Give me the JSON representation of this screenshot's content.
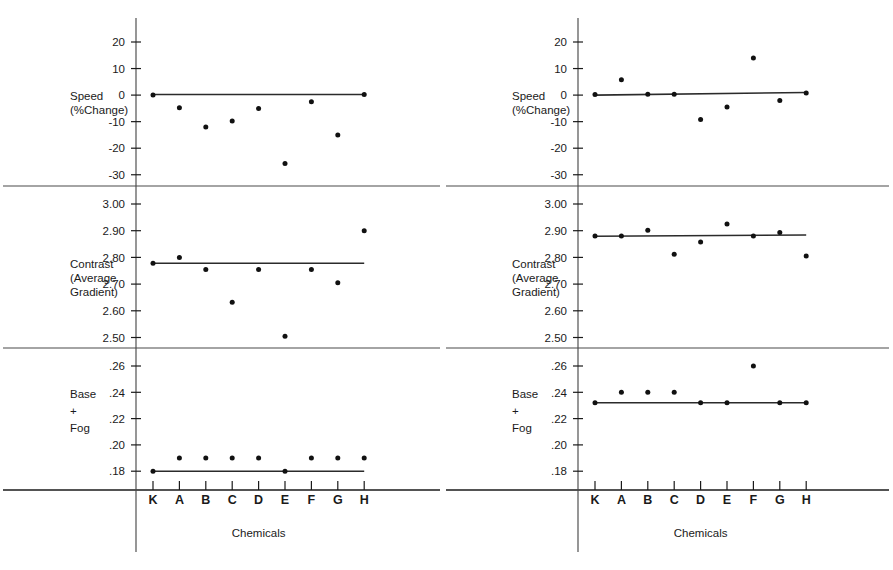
{
  "figure": {
    "panels": [
      {
        "id": "left",
        "x_title": "Chemicals",
        "categories": [
          "K",
          "A",
          "B",
          "C",
          "D",
          "E",
          "F",
          "G",
          "H"
        ],
        "sections": [
          {
            "id": "speed",
            "axis_label_lines": [
              "Speed",
              "(%Change)"
            ],
            "ticks": [
              "20",
              "10",
              "0",
              "-10",
              "-20",
              "-30"
            ],
            "tick_values": [
              20,
              10,
              0,
              -10,
              -20,
              -30
            ],
            "values": [
              0,
              -4.8,
              -12.0,
              -9.8,
              -5.0,
              -25.8,
              -2.5,
              -15.0,
              0.2
            ],
            "reference_line": {
              "from": 0,
              "to": 8,
              "y_from": 0.2,
              "y_to": 0.2
            }
          },
          {
            "id": "contrast",
            "axis_label_lines": [
              "Contrast",
              "(Average",
              "Gradient)"
            ],
            "ticks": [
              "3.00",
              "2.90",
              "2.80",
              "2.70",
              "2.60",
              "2.50"
            ],
            "tick_values": [
              3.0,
              2.9,
              2.8,
              2.7,
              2.6,
              2.5
            ],
            "values": [
              2.778,
              2.8,
              2.755,
              2.632,
              2.755,
              2.505,
              2.755,
              2.705,
              2.9
            ],
            "reference_line": {
              "from": 0,
              "to": 8,
              "y_from": 2.778,
              "y_to": 2.778
            }
          },
          {
            "id": "base-fog",
            "axis_label_lines": [
              "Base",
              "+",
              "Fog"
            ],
            "ticks": [
              ".26",
              ".24",
              ".22",
              ".20",
              ".18"
            ],
            "tick_values": [
              0.26,
              0.24,
              0.22,
              0.2,
              0.18
            ],
            "values": [
              0.18,
              0.19,
              0.19,
              0.19,
              0.19,
              0.18,
              0.19,
              0.19,
              0.19
            ],
            "reference_line": {
              "from": 0,
              "to": 8,
              "y_from": 0.18,
              "y_to": 0.18
            }
          }
        ]
      },
      {
        "id": "right",
        "x_title": "Chemicals",
        "categories": [
          "K",
          "A",
          "B",
          "C",
          "D",
          "E",
          "F",
          "G",
          "H"
        ],
        "sections": [
          {
            "id": "speed",
            "axis_label_lines": [
              "Speed",
              "(%Change)"
            ],
            "ticks": [
              "20",
              "10",
              "0",
              "-10",
              "-20",
              "-30"
            ],
            "tick_values": [
              20,
              10,
              0,
              -10,
              -20,
              -30
            ],
            "values": [
              0.2,
              5.8,
              0.3,
              0.3,
              -9.2,
              -4.5,
              14.0,
              -2.0,
              0.8
            ],
            "reference_line": {
              "from": 0,
              "to": 8,
              "y_from": 0.0,
              "y_to": 1.0
            }
          },
          {
            "id": "contrast",
            "axis_label_lines": [
              "Contrast",
              "(Average",
              "Gradient)"
            ],
            "ticks": [
              "3.00",
              "2.90",
              "2.80",
              "2.70",
              "2.60",
              "2.50"
            ],
            "tick_values": [
              3.0,
              2.9,
              2.8,
              2.7,
              2.6,
              2.5
            ],
            "values": [
              2.88,
              2.88,
              2.902,
              2.812,
              2.858,
              2.925,
              2.88,
              2.893,
              2.805
            ],
            "reference_line": {
              "from": 0,
              "to": 8,
              "y_from": 2.879,
              "y_to": 2.884
            }
          },
          {
            "id": "base-fog",
            "axis_label_lines": [
              "Base",
              "+",
              "Fog"
            ],
            "ticks": [
              ".26",
              ".24",
              ".22",
              ".20",
              ".18"
            ],
            "tick_values": [
              0.26,
              0.24,
              0.22,
              0.2,
              0.18
            ],
            "values": [
              0.232,
              0.24,
              0.24,
              0.24,
              0.232,
              0.232,
              0.26,
              0.232,
              0.232
            ],
            "reference_line": {
              "from": 0,
              "to": 8,
              "y_from": 0.232,
              "y_to": 0.232
            }
          }
        ]
      }
    ]
  },
  "chart_data": {
    "type": "scatter",
    "title": "",
    "xlabel": "Chemicals",
    "categories": [
      "K",
      "A",
      "B",
      "C",
      "D",
      "E",
      "F",
      "G",
      "H"
    ],
    "panels": [
      {
        "panel": "left",
        "subplots": [
          {
            "ylabel": "Speed (%Change)",
            "ylim": [
              -35,
              24
            ],
            "yticks": [
              20,
              10,
              0,
              -10,
              -20,
              -30
            ],
            "series": [
              {
                "name": "Speed (%Change)",
                "values": [
                  0,
                  -4.8,
                  -12.0,
                  -9.8,
                  -5.0,
                  -25.8,
                  -2.5,
                  -15.0,
                  0.2
                ]
              }
            ],
            "reference_line": {
              "y": 0.2,
              "note": "control reference level at 0% change"
            }
          },
          {
            "ylabel": "Contrast (Average Gradient)",
            "ylim": [
              2.46,
              3.04
            ],
            "yticks": [
              3.0,
              2.9,
              2.8,
              2.7,
              2.6,
              2.5
            ],
            "series": [
              {
                "name": "Contrast (Average Gradient)",
                "values": [
                  2.778,
                  2.8,
                  2.755,
                  2.632,
                  2.755,
                  2.505,
                  2.755,
                  2.705,
                  2.9
                ]
              }
            ],
            "reference_line": {
              "y": 2.778,
              "note": "control reference level"
            }
          },
          {
            "ylabel": "Base + Fog",
            "ylim": [
              0.168,
              0.272
            ],
            "yticks": [
              0.26,
              0.24,
              0.22,
              0.2,
              0.18
            ],
            "series": [
              {
                "name": "Base + Fog",
                "values": [
                  0.18,
                  0.19,
                  0.19,
                  0.19,
                  0.19,
                  0.18,
                  0.19,
                  0.19,
                  0.19
                ]
              }
            ],
            "reference_line": {
              "y": 0.18,
              "note": "control reference level"
            }
          }
        ]
      },
      {
        "panel": "right",
        "subplots": [
          {
            "ylabel": "Speed (%Change)",
            "ylim": [
              -35,
              24
            ],
            "yticks": [
              20,
              10,
              0,
              -10,
              -20,
              -30
            ],
            "series": [
              {
                "name": "Speed (%Change)",
                "values": [
                  0.2,
                  5.8,
                  0.3,
                  0.3,
                  -9.2,
                  -4.5,
                  14.0,
                  -2.0,
                  0.8
                ]
              }
            ],
            "reference_line": {
              "y": 0.5,
              "note": "control reference level near 0% change"
            }
          },
          {
            "ylabel": "Contrast (Average Gradient)",
            "ylim": [
              2.46,
              3.04
            ],
            "yticks": [
              3.0,
              2.9,
              2.8,
              2.7,
              2.6,
              2.5
            ],
            "series": [
              {
                "name": "Contrast (Average Gradient)",
                "values": [
                  2.88,
                  2.88,
                  2.902,
                  2.812,
                  2.858,
                  2.925,
                  2.88,
                  2.893,
                  2.805
                ]
              }
            ],
            "reference_line": {
              "y": 2.881,
              "note": "control reference level"
            }
          },
          {
            "ylabel": "Base + Fog",
            "ylim": [
              0.168,
              0.272
            ],
            "yticks": [
              0.26,
              0.24,
              0.22,
              0.2,
              0.18
            ],
            "series": [
              {
                "name": "Base + Fog",
                "values": [
                  0.232,
                  0.24,
                  0.24,
                  0.24,
                  0.232,
                  0.232,
                  0.26,
                  0.232,
                  0.232
                ]
              }
            ],
            "reference_line": {
              "y": 0.232,
              "note": "control reference level"
            }
          }
        ]
      }
    ],
    "grid": false,
    "legend": "none"
  }
}
